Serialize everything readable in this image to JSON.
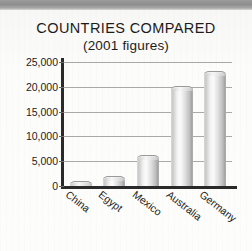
{
  "chart_data": {
    "type": "bar",
    "title": "COUNTRIES COMPARED",
    "subtitle": "(2001 figures)",
    "categories": [
      "China",
      "Egypt",
      "Mexico",
      "Australia",
      "Germany"
    ],
    "values": [
      900,
      1800,
      6000,
      20000,
      23000
    ],
    "yticks": [
      0,
      5000,
      10000,
      15000,
      20000,
      25000
    ],
    "ytick_labels": [
      "0",
      "5,000",
      "10,000",
      "15,000",
      "20,000",
      "25,000"
    ],
    "ylim": [
      0,
      25000
    ],
    "xlabel": "",
    "ylabel": "",
    "grid": true,
    "legend": false,
    "series": [
      {
        "name": "2001 figures",
        "values": [
          900,
          1800,
          6000,
          20000,
          23000
        ]
      }
    ],
    "colors": {
      "bar_light": "#fbfbfb",
      "bar_mid": "#d9d9d9",
      "bar_dark": "#9f9f9f",
      "axis": "#2a2a2a",
      "gridline": "#a9a9a9",
      "text": "#1c1c1c",
      "paper": "#fdfdfc",
      "top_band": "#9c9c9c"
    }
  }
}
